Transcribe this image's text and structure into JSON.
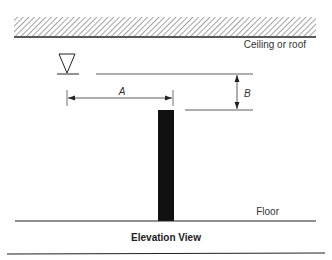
{
  "diagram": {
    "labels": {
      "ceiling": "Ceiling or roof",
      "floor": "Floor",
      "dimension_a": "A",
      "dimension_b": "B",
      "caption": "Elevation View"
    },
    "symbols": {
      "level_marker": "inverted-triangle-icon"
    },
    "colors": {
      "line": "#222222",
      "column": "#111111",
      "hatch": "#555555",
      "text": "#333333"
    }
  }
}
